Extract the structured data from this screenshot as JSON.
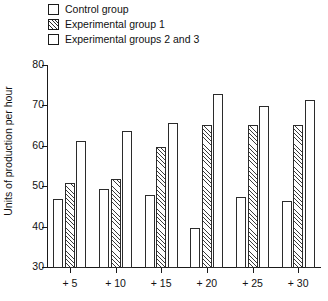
{
  "legend": {
    "position": "top-left",
    "items": [
      {
        "label": "Control group",
        "swatch": "open-square-icon",
        "pattern": "open"
      },
      {
        "label": "Experimental group 1",
        "swatch": "hatched-square-icon",
        "pattern": "hatched"
      },
      {
        "label": "Experimental groups 2 and 3",
        "swatch": "open-square-icon",
        "pattern": "open"
      }
    ]
  },
  "axes": {
    "ylabel": "Units of production per hour",
    "xlabel": "",
    "yticks": [
      30,
      40,
      50,
      60,
      70,
      80
    ],
    "ytick_labels": [
      "30",
      "40",
      "50",
      "60",
      "70",
      "80"
    ],
    "xtick_labels": [
      "+ 5",
      "+ 10",
      "+ 15",
      "+ 20",
      "+ 25",
      "+ 30"
    ]
  },
  "chart_data": {
    "type": "bar",
    "title": "",
    "xlabel": "",
    "ylabel": "Units of production per hour",
    "categories": [
      "+ 5",
      "+ 10",
      "+ 15",
      "+ 20",
      "+ 25",
      "+ 30"
    ],
    "series": [
      {
        "name": "Control group",
        "pattern": "open",
        "values": [
          47,
          49.5,
          48,
          40,
          47.5,
          46.5
        ]
      },
      {
        "name": "Experimental group 1",
        "pattern": "hatched",
        "values": [
          51,
          52,
          60,
          65.5,
          65.5,
          65.5
        ]
      },
      {
        "name": "Experimental groups 2 and 3",
        "pattern": "open",
        "values": [
          61.5,
          64,
          66,
          73,
          70,
          71.5
        ]
      }
    ],
    "ylim": [
      30,
      80
    ],
    "grid": false,
    "legend_position": "top-left"
  },
  "style": {
    "line_color": "#2b2b2b",
    "text_color": "#111111",
    "background": "#ffffff"
  }
}
